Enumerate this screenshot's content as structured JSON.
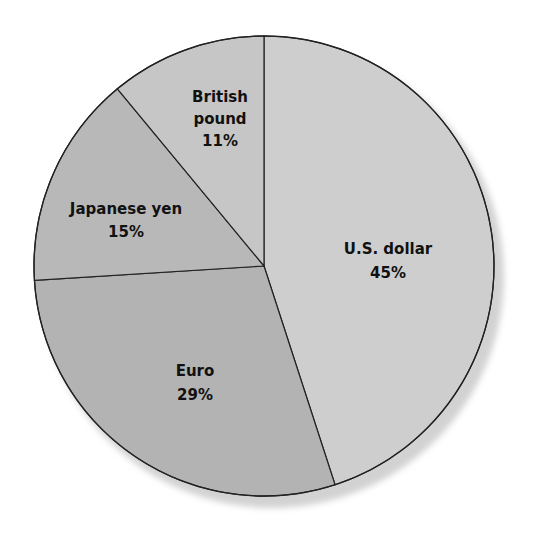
{
  "chart_data": {
    "type": "pie",
    "title": "",
    "start_angle_deg": -90,
    "direction": "clockwise",
    "slices": [
      {
        "label": "U.S. dollar",
        "value": 45,
        "display": "45%",
        "color": "#cecece"
      },
      {
        "label": "Euro",
        "value": 29,
        "display": "29%",
        "color": "#b3b3b3"
      },
      {
        "label": "Japanese yen",
        "value": 15,
        "display": "15%",
        "color": "#b8b8b8"
      },
      {
        "label": "British pound",
        "value": 11,
        "display": "11%",
        "color": "#c6c6c6"
      }
    ],
    "legend": "none",
    "labels_inside": true
  },
  "labels": {
    "usd": {
      "line1": "U.S. dollar",
      "line2": "45%"
    },
    "eur": {
      "line1": "Euro",
      "line2": "29%"
    },
    "jpy": {
      "line1": "Japanese yen",
      "line2": "15%"
    },
    "gbp": {
      "line1": "British",
      "line2": "pound",
      "line3": "11%"
    }
  },
  "colors": {
    "outline": "#222222",
    "shadow": "#d4d4d4"
  }
}
